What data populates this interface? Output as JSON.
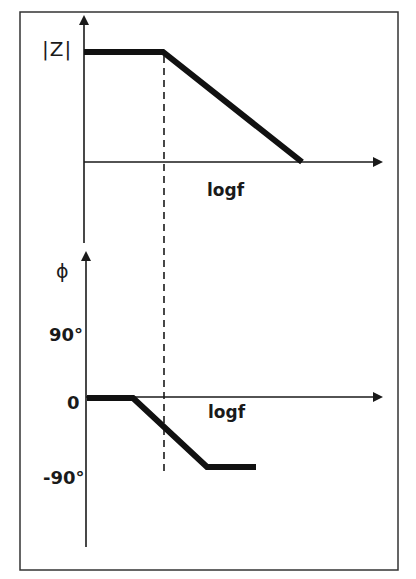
{
  "diagram": {
    "magnitude_plot": {
      "y_axis_label": "|Z|",
      "x_axis_label": "logf"
    },
    "phase_plot": {
      "y_axis_label": "ϕ",
      "x_axis_label": "logf",
      "tick_labels": [
        "90°",
        "0",
        "-90°"
      ]
    },
    "colors": {
      "line": "#111111",
      "axis": "#1a1a1a",
      "frame": "#333333",
      "background": "#ffffff"
    }
  }
}
